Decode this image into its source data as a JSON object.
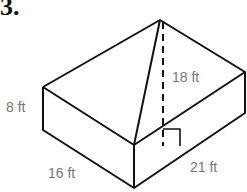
{
  "problem": {
    "number": "3."
  },
  "diagram": {
    "type": "rectangular prism with pyramid",
    "labels": {
      "height_box": "8 ft",
      "length": "16 ft",
      "width": "21 ft",
      "pyramid_height": "18 ft"
    }
  }
}
